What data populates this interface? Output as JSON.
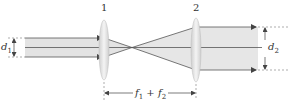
{
  "diagram": {
    "type": "optics-beam-expander",
    "lenses": [
      {
        "id": "1",
        "label": "1",
        "x": 104
      },
      {
        "id": "2",
        "label": "2",
        "x": 196
      }
    ],
    "input_beam": {
      "label_main": "d",
      "label_sub": "1"
    },
    "output_beam": {
      "label_main": "d",
      "label_sub": "2"
    },
    "separation": {
      "label_f1": "f",
      "label_f1_sub": "1",
      "label_plus": " + ",
      "label_f2": "f",
      "label_f2_sub": "2"
    },
    "colors": {
      "beam_fill": "#e3e3e3",
      "ray": "#444444",
      "dashed": "#777777",
      "lens_fill": "#dcdcdc",
      "text": "#333333"
    }
  }
}
